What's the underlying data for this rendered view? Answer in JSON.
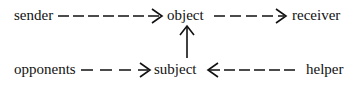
{
  "diagram": {
    "type": "actantial-model",
    "nodes": {
      "sender": "sender",
      "object": "object",
      "receiver": "receiver",
      "opponents": "opponents",
      "subject": "subject",
      "helper": "helper"
    },
    "edges": [
      {
        "from": "sender",
        "to": "object",
        "style": "dashed"
      },
      {
        "from": "object",
        "to": "receiver",
        "style": "dashed"
      },
      {
        "from": "subject",
        "to": "object",
        "style": "solid"
      },
      {
        "from": "opponents",
        "to": "subject",
        "style": "dashed"
      },
      {
        "from": "helper",
        "to": "subject",
        "style": "dashed"
      }
    ],
    "colors": {
      "ink": "#111111",
      "background": "#ffffff"
    }
  }
}
